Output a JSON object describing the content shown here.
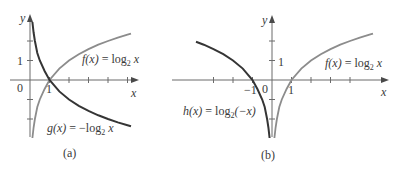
{
  "figure": {
    "panels": [
      {
        "id": "a",
        "caption": "(a)",
        "axes": {
          "x_label": "x",
          "y_label": "y",
          "origin_label": "0",
          "x_tick_label": "1",
          "y_tick_label": "1"
        },
        "curves": [
          {
            "name": "f",
            "label_fn": "f(x)",
            "label_eq": " = log",
            "label_sub": "2",
            "label_arg": " x",
            "style": "light"
          },
          {
            "name": "g",
            "label_fn": "g(x)",
            "label_eq": " = −log",
            "label_sub": "2",
            "label_arg": " x",
            "style": "dark"
          }
        ]
      },
      {
        "id": "b",
        "caption": "(b)",
        "axes": {
          "x_label": "x",
          "y_label": "y",
          "origin_label": "0",
          "x_tick_label_pos": "1",
          "x_tick_label_neg": "−1",
          "y_tick_label": "1"
        },
        "curves": [
          {
            "name": "f",
            "label_fn": "f(x)",
            "label_eq": " = log",
            "label_sub": "2",
            "label_arg": " x",
            "style": "light"
          },
          {
            "name": "h",
            "label_fn": "h(x)",
            "label_eq": " = log",
            "label_sub": "2",
            "label_arg": "(−x)",
            "style": "dark"
          }
        ]
      }
    ],
    "colors": {
      "axis": "#6b6b6b",
      "dark_curve": "#353535",
      "light_curve": "#8c8c8c",
      "text": "#3a3a3a",
      "background": "#ffffff"
    }
  }
}
